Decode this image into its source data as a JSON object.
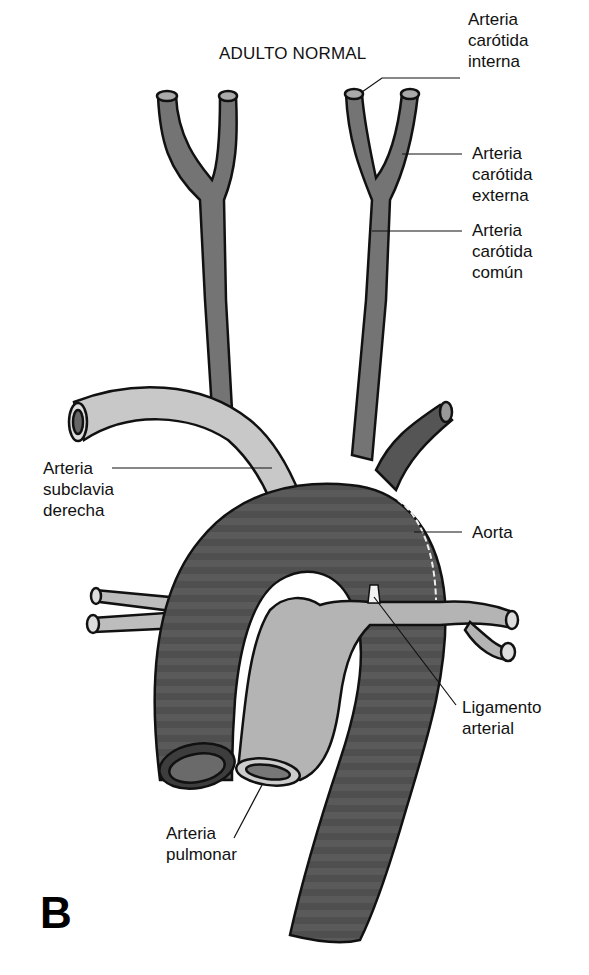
{
  "figure": {
    "title": "ADULTO NORMAL",
    "panel_letter": "B",
    "colors": {
      "aorta": "#5c5c5c",
      "aorta_dark": "#4a4a4a",
      "pulmonary": "#b4b4b4",
      "subclavian": "#c8c8c8",
      "carotid": "#747474",
      "outline": "#111111",
      "background": "#ffffff"
    },
    "labels": [
      {
        "id": "carotida-interna",
        "text": "Arteria\ncarótida\ninterna"
      },
      {
        "id": "carotida-externa",
        "text": "Arteria\ncarótida\nexterna"
      },
      {
        "id": "carotida-comun",
        "text": "Arteria\ncarótida\ncomún"
      },
      {
        "id": "subclavia-derecha",
        "text": "Arteria\nsubclavia\nderecha"
      },
      {
        "id": "aorta",
        "text": "Aorta"
      },
      {
        "id": "ligamento-arterial",
        "text": "Ligamento\narterial"
      },
      {
        "id": "arteria-pulmonar",
        "text": "Arteria\npulmonar"
      }
    ]
  }
}
